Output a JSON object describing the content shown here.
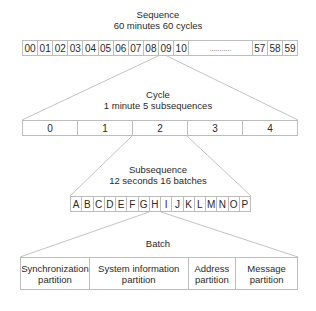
{
  "sequence": {
    "title": "Sequence",
    "subtitle": "60 minutes  60 cycles",
    "cells": [
      "00",
      "01",
      "02",
      "03",
      "04",
      "05",
      "06",
      "07",
      "08",
      "09",
      "10"
    ],
    "ellipsis": "...........",
    "tail_cells": [
      "57",
      "58",
      "59"
    ],
    "expanded_cell": "08"
  },
  "cycle": {
    "title": "Cycle",
    "subtitle": "1 minute  5 subsequences",
    "cells": [
      "0",
      "1",
      "2",
      "3",
      "4"
    ],
    "expanded_cell": "2"
  },
  "subsequence": {
    "title": "Subsequence",
    "subtitle": "12 seconds  16 batches",
    "cells": [
      "A",
      "B",
      "C",
      "D",
      "E",
      "F",
      "G",
      "H",
      "I",
      "J",
      "K",
      "L",
      "M",
      "N",
      "O",
      "P"
    ],
    "expanded_cell": "H"
  },
  "batch": {
    "title": "Batch",
    "partitions": [
      {
        "line1": "Synchronization",
        "line2": "partition"
      },
      {
        "line1": "System information",
        "line2": "partition"
      },
      {
        "line1": "Address",
        "line2": "partition"
      },
      {
        "line1": "Message",
        "line2": "partition"
      }
    ]
  },
  "colors": {
    "line": "#c4c4c4",
    "border": "#bdbdbd",
    "text": "#2a2a2a"
  }
}
